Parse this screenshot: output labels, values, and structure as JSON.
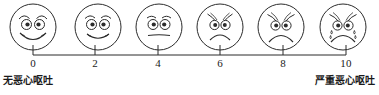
{
  "scale": {
    "name": "nausea-vomiting-faces-rating-scale",
    "orientation": "horizontal",
    "line_color": "#2b2b2b",
    "face_stroke_color": "#2b2b2b",
    "axis": {
      "min": 0,
      "max": 10,
      "tick_values": [
        0,
        2,
        4,
        6,
        8,
        10
      ],
      "tick_labels": [
        "0",
        "2",
        "4",
        "6",
        "8",
        "10"
      ]
    },
    "anchors": {
      "left_label": "无恶心呕吐",
      "right_label": "严重恶心呕吐"
    },
    "faces": [
      {
        "value": "0",
        "expression": "smiling",
        "icon": "face-smiling-icon"
      },
      {
        "value": "2",
        "expression": "slight-smile",
        "icon": "face-slight-smile-icon"
      },
      {
        "value": "4",
        "expression": "neutral",
        "icon": "face-neutral-icon"
      },
      {
        "value": "6",
        "expression": "frowning",
        "icon": "face-frowning-icon"
      },
      {
        "value": "8",
        "expression": "very-frowning",
        "icon": "face-very-frowning-icon"
      },
      {
        "value": "10",
        "expression": "crying",
        "icon": "face-crying-icon"
      }
    ]
  }
}
